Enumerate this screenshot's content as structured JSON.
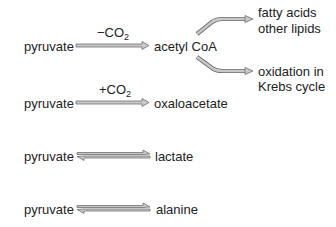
{
  "colors": {
    "arrow_fill": "#c8c8c8",
    "arrow_stroke": "#6e6e6e",
    "text": "#222222"
  },
  "reactions": [
    {
      "substrate": "pyruvate",
      "condition_prefix": "−CO",
      "condition_sub": "2",
      "product": "acetyl CoA",
      "arrow": "forward"
    },
    {
      "substrate": "pyruvate",
      "condition_prefix": "+CO",
      "condition_sub": "2",
      "product": "oxaloacetate",
      "arrow": "forward"
    },
    {
      "substrate": "pyruvate",
      "product": "lactate",
      "arrow": "reversible"
    },
    {
      "substrate": "pyruvate",
      "product": "alanine",
      "arrow": "reversible"
    }
  ],
  "branches": [
    {
      "line1": "fatty acids",
      "line2": "other lipids"
    },
    {
      "line1": "oxidation in",
      "line2": "Krebs cycle"
    }
  ]
}
